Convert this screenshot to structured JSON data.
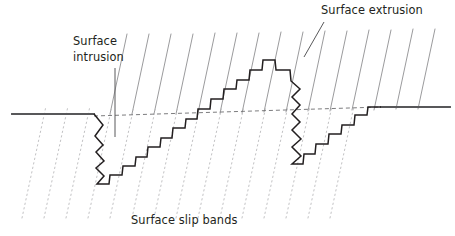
{
  "figure": {
    "background_color": "#ffffff"
  },
  "labels": {
    "surface_intrusion": {
      "line1": "Surface",
      "line2": "intrusion",
      "x": 73,
      "y_line1": 45,
      "y_line2": 61
    },
    "surface_extrusion": {
      "text": "Surface extrusion",
      "x": 321,
      "y": 14
    },
    "surface_slip_bands": {
      "text": "Surface slip bands",
      "x": 131,
      "y": 224
    }
  },
  "colors": {
    "text": "#231f20",
    "surface_line": "#58585a",
    "profile_line": "#231f20",
    "slip_band_solid": "#9b9b9d",
    "slip_band_dotted": "#c4c4c6",
    "dashed_datum": "#6d6d6f",
    "leader_line": "#58585a"
  },
  "geometry": {
    "surface_line_left": {
      "x1": 12,
      "y1": 114,
      "x2": 94,
      "y2": 114
    },
    "surface_line_right": {
      "x1": 381,
      "y1": 107,
      "x2": 450,
      "y2": 107
    },
    "datum_dashed": {
      "x1": 94,
      "y1": 116,
      "x2": 381,
      "y2": 107
    },
    "leader_intrusion": {
      "x1": 115,
      "y1": 68,
      "x2": 115,
      "y2": 137
    },
    "leader_extrusion": {
      "x1": 324,
      "y1": 22,
      "x2": 304,
      "y2": 57
    },
    "slip_band_slope_dx": -0.7,
    "slip_band_spacing": 22,
    "slip_band_count": 14,
    "profile_points": "94,114 103,125 95,136 103,145 96,152 104,161 96,168 104,176 97,184 109,184 110,175 122,175 123,166 135,166 136,157 147,157 148,147 160,147 161,138 172,138 173,128 185,128 186,119 197,119 198,109 210,109 211,99 223,99 224,89 236,89 237,80 249,80 250,70 262,70 263,60 275,60 276,70 290,70 291,81 300,89 292,97 300,105 292,114 300,122 292,130 301,139 292,147 301,156 292,164 303,164 304,154 315,154 316,144 328,144 329,134 341,134 342,125 354,125 355,115 367,115 368,107 381,107"
  },
  "elements": {
    "left_surface": "left-surface-line",
    "right_surface": "right-surface-line",
    "profile": "fatigue-crack-profile",
    "datum": "datum-dashed-line"
  }
}
